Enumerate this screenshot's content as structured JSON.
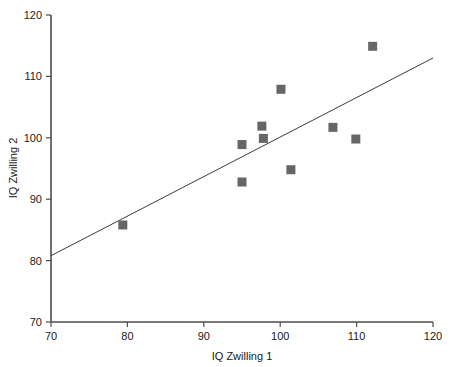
{
  "chart_data": {
    "type": "scatter",
    "title": "",
    "xlabel": "IQ Zwilling 1",
    "ylabel": "IQ Zwilling 2",
    "xlim": [
      70,
      120
    ],
    "ylim": [
      70,
      120
    ],
    "xticks": [
      70,
      80,
      90,
      100,
      110,
      120
    ],
    "yticks": [
      70,
      80,
      90,
      100,
      110,
      120
    ],
    "xtick_labels": [
      "70",
      "80",
      "90",
      "100",
      "110",
      "120"
    ],
    "ytick_labels": [
      "70",
      "80",
      "90",
      "100",
      "110",
      "120"
    ],
    "grid": false,
    "legend": null,
    "marker_shape": "square",
    "marker_color": "#666666",
    "points": [
      {
        "x": 79.4,
        "y": 85.8
      },
      {
        "x": 95.0,
        "y": 92.8
      },
      {
        "x": 95.0,
        "y": 98.9
      },
      {
        "x": 97.6,
        "y": 101.9
      },
      {
        "x": 97.8,
        "y": 99.9
      },
      {
        "x": 100.1,
        "y": 107.9
      },
      {
        "x": 101.4,
        "y": 94.8
      },
      {
        "x": 106.9,
        "y": 101.7
      },
      {
        "x": 109.9,
        "y": 99.8
      },
      {
        "x": 112.1,
        "y": 114.9
      }
    ],
    "series": [
      {
        "name": "IQ Zwilling pairs",
        "x": [
          79.4,
          95.0,
          95.0,
          97.6,
          97.8,
          100.1,
          101.4,
          106.9,
          109.9,
          112.1
        ],
        "values": [
          85.8,
          92.8,
          98.9,
          101.9,
          99.9,
          107.9,
          94.8,
          101.7,
          99.8,
          114.9
        ]
      }
    ],
    "trend_line": {
      "type": "line",
      "x": [
        70,
        120
      ],
      "y": [
        80.8,
        113.0
      ],
      "color": "#3c3c3c"
    },
    "annotations": []
  },
  "axes": {
    "x_title": "IQ Zwilling 1",
    "y_title": "IQ Zwilling 2"
  }
}
